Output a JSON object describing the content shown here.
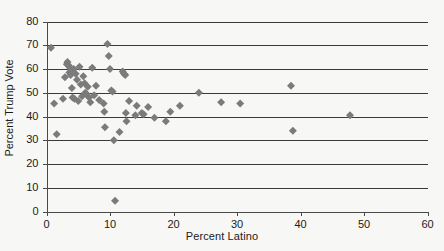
{
  "chart_data": {
    "type": "scatter",
    "title": "",
    "xlabel": "Percent Latino",
    "ylabel": "Percent Trump Vote",
    "xlim": [
      0,
      60
    ],
    "ylim": [
      0,
      80
    ],
    "xticks": [
      0,
      10,
      20,
      30,
      40,
      50,
      60
    ],
    "yticks": [
      0,
      10,
      20,
      30,
      40,
      50,
      60,
      70,
      80
    ],
    "grid": "horizontal",
    "legend": "none",
    "marker": "diamond",
    "marker_color": "#7b7b7b",
    "series": [
      {
        "name": "Counties",
        "points": [
          [
            0.7,
            69.0
          ],
          [
            1.2,
            45.5
          ],
          [
            1.6,
            32.5
          ],
          [
            2.6,
            47.5
          ],
          [
            2.9,
            56.5
          ],
          [
            3.2,
            62.0
          ],
          [
            3.3,
            63.0
          ],
          [
            3.5,
            61.5
          ],
          [
            3.6,
            58.5
          ],
          [
            3.7,
            60.5
          ],
          [
            3.8,
            57.5
          ],
          [
            3.9,
            59.5
          ],
          [
            4.0,
            52.0
          ],
          [
            4.1,
            48.0
          ],
          [
            4.3,
            60.0
          ],
          [
            4.4,
            47.5
          ],
          [
            4.6,
            58.0
          ],
          [
            4.8,
            55.5
          ],
          [
            5.0,
            46.5
          ],
          [
            5.2,
            61.0
          ],
          [
            5.4,
            53.5
          ],
          [
            5.6,
            48.5
          ],
          [
            5.8,
            57.0
          ],
          [
            6.0,
            54.0
          ],
          [
            6.1,
            50.0
          ],
          [
            6.3,
            49.5
          ],
          [
            6.5,
            52.5
          ],
          [
            6.7,
            48.0
          ],
          [
            6.9,
            46.0
          ],
          [
            7.2,
            60.5
          ],
          [
            7.5,
            49.0
          ],
          [
            7.8,
            53.0
          ],
          [
            8.3,
            47.0
          ],
          [
            9.0,
            45.5
          ],
          [
            9.1,
            42.0
          ],
          [
            9.2,
            35.5
          ],
          [
            9.6,
            70.5
          ],
          [
            9.8,
            65.5
          ],
          [
            10.0,
            60.0
          ],
          [
            10.2,
            51.0
          ],
          [
            10.4,
            50.5
          ],
          [
            10.6,
            30.0
          ],
          [
            10.8,
            4.5
          ],
          [
            11.5,
            33.5
          ],
          [
            12.0,
            59.0
          ],
          [
            12.2,
            58.0
          ],
          [
            12.4,
            57.5
          ],
          [
            12.5,
            41.5
          ],
          [
            12.6,
            38.0
          ],
          [
            13.0,
            46.5
          ],
          [
            14.0,
            40.5
          ],
          [
            14.2,
            44.5
          ],
          [
            15.0,
            41.5
          ],
          [
            15.3,
            41.0
          ],
          [
            16.0,
            44.0
          ],
          [
            17.0,
            39.5
          ],
          [
            18.8,
            38.0
          ],
          [
            19.5,
            42.0
          ],
          [
            21.0,
            44.5
          ],
          [
            24.0,
            50.0
          ],
          [
            27.5,
            46.0
          ],
          [
            30.5,
            45.5
          ],
          [
            38.5,
            53.0
          ],
          [
            38.8,
            34.0
          ],
          [
            47.8,
            40.5
          ]
        ]
      }
    ]
  },
  "axes": {
    "x_tick_labels": [
      "0",
      "10",
      "20",
      "30",
      "40",
      "50",
      "60"
    ],
    "y_tick_labels": [
      "0",
      "10",
      "20",
      "30",
      "40",
      "50",
      "60",
      "70",
      "80"
    ],
    "x_axis_title": "Percent Latino",
    "y_axis_title": "Percent Trump Vote"
  }
}
